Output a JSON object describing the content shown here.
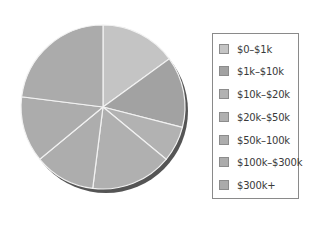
{
  "chart_data": {
    "type": "pie",
    "title": "",
    "categories": [
      "$0–$1k",
      "$1k–$10k",
      "$10k–$20k",
      "$20k–$50k",
      "$50k–100k",
      "$100k–$300k",
      "$300k+"
    ],
    "values": [
      15,
      14,
      7,
      16,
      12,
      13,
      23
    ],
    "unit": "percent (estimated from slice angles)",
    "start_angle_deg": 0,
    "direction": "clockwise",
    "colors": [
      "#c4c4c4",
      "#a2a2a2",
      "#b2b2b2",
      "#b0b0b0",
      "#adadad",
      "#acacac",
      "#ababab"
    ],
    "legend_position": "right",
    "shadow": true
  },
  "legend": {
    "items": [
      {
        "label": "$0–$1k",
        "color": "#c4c4c4"
      },
      {
        "label": "$1k–$10k",
        "color": "#a2a2a2"
      },
      {
        "label": "$10k–$20k",
        "color": "#b2b2b2"
      },
      {
        "label": "$20k–$50k",
        "color": "#b0b0b0"
      },
      {
        "label": "$50k–100k",
        "color": "#adadad"
      },
      {
        "label": "$100k–$300k",
        "color": "#acacac"
      },
      {
        "label": "$300k+",
        "color": "#ababab"
      }
    ]
  }
}
